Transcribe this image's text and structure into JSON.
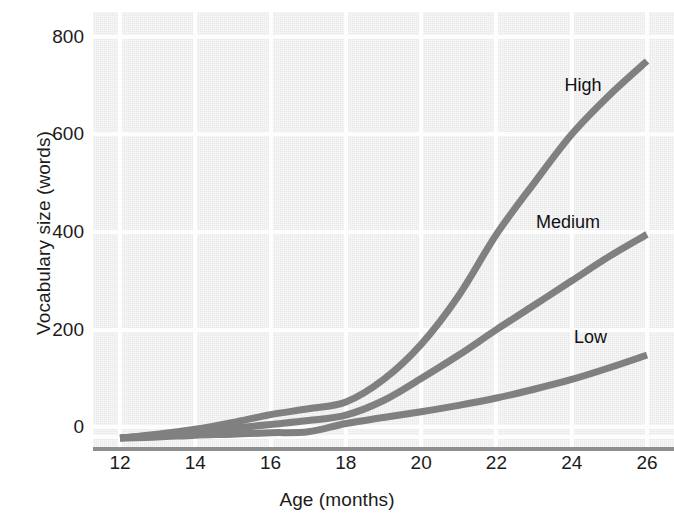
{
  "chart_data": {
    "type": "line",
    "title": "",
    "xlabel": "Age (months)",
    "ylabel": "Vocabulary size (words)",
    "xlim": [
      12,
      26
    ],
    "ylim": [
      -30,
      840
    ],
    "xticks": [
      12,
      14,
      16,
      18,
      20,
      22,
      24,
      26
    ],
    "yticks": [
      0,
      200,
      400,
      600,
      800
    ],
    "xtick_labels": [
      "12",
      "14",
      "16",
      "18",
      "20",
      "22",
      "24",
      "26"
    ],
    "ytick_labels": [
      "0",
      "200",
      "400",
      "600",
      "800"
    ],
    "grid": true,
    "legend_position": "inline-end-of-line",
    "x": [
      12,
      13,
      14,
      15,
      16,
      17,
      18,
      19,
      20,
      21,
      22,
      23,
      24,
      25,
      26
    ],
    "series": [
      {
        "name": "High",
        "label": "High",
        "color": "#808080",
        "values": [
          -22,
          -14,
          -4,
          10,
          26,
          38,
          52,
          98,
          170,
          270,
          395,
          500,
          600,
          680,
          750
        ]
      },
      {
        "name": "Medium",
        "label": "Medium",
        "color": "#808080",
        "values": [
          -22,
          -16,
          -10,
          -2,
          6,
          14,
          25,
          55,
          100,
          148,
          200,
          250,
          300,
          350,
          395
        ]
      },
      {
        "name": "Low",
        "label": "Low",
        "color": "#808080",
        "values": [
          -22,
          -20,
          -16,
          -14,
          -11,
          -9,
          8,
          20,
          32,
          45,
          60,
          78,
          98,
          122,
          148
        ]
      }
    ],
    "annotations": [
      {
        "text": "High",
        "x": 24.3,
        "y": 700
      },
      {
        "text": "Medium",
        "x": 23.9,
        "y": 420
      },
      {
        "text": "Low",
        "x": 24.5,
        "y": 185
      }
    ],
    "style": {
      "plot_background": "#e9e9e9",
      "gridline_color": "#fdfdfd",
      "axis_color": "#8e8e8e",
      "line_color": "#808080",
      "line_width": 7,
      "text_color": "#1b1b1b"
    }
  }
}
